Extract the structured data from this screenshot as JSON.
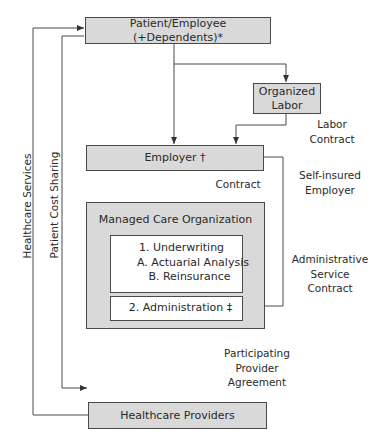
{
  "diagram": {
    "nodes": {
      "patient": "Patient/Employee (+Dependents)*",
      "organized_labor_line1": "Organized",
      "organized_labor_line2": "Labor",
      "employer": "Employer  †",
      "mco_title": "Managed Care Organization",
      "underwriting": {
        "item1": "1.   Underwriting",
        "item1a": "A.  Actuarial Analysis",
        "item1b": "B.  Reinsurance"
      },
      "administration": "2.   Administration  ‡",
      "providers": "Healthcare Providers"
    },
    "edge_labels": {
      "labor_contract_line1": "Labor",
      "labor_contract_line2": "Contract",
      "contract": "Contract",
      "self_insured_line1": "Self-insured",
      "self_insured_line2": "Employer",
      "admin_service_line1": "Administrative",
      "admin_service_line2": "Service",
      "admin_service_line3": "Contract",
      "participating_line1": "Participating",
      "participating_line2": "Provider",
      "participating_line3": "Agreement",
      "healthcare_services": "Healthcare Services",
      "patient_cost_sharing": "Patient Cost Sharing"
    },
    "colors": {
      "box_fill": "#d9d9d9",
      "inner_fill": "#ffffff",
      "line": "#4a4a4a"
    }
  }
}
